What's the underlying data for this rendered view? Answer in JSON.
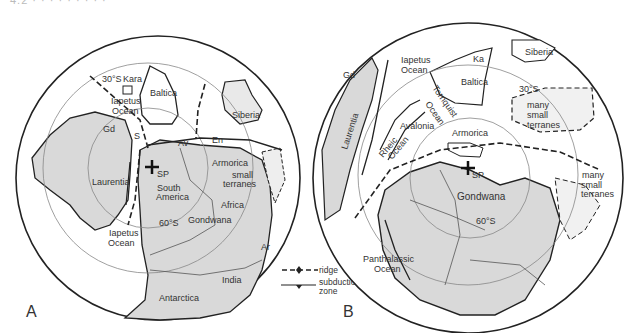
{
  "header": {
    "text": "4.2     ·  ·  ·  ·  ·  ·  ·  ·  ·"
  },
  "panel_a": {
    "letter": "A",
    "labels": {
      "lat30": "30°S",
      "kara": "Kara",
      "baltica": "Baltica",
      "iapetus1": "Iapetus",
      "ocean1": "Ocean",
      "siberia": "Siberia",
      "gd": "Gd",
      "s": "S",
      "av": "Av",
      "en": "En",
      "armorica": "Armorica",
      "sp": "SP",
      "laurentia": "Laurentia",
      "south": "South",
      "america": "America",
      "small": "small",
      "terranes": "terranes",
      "africa": "Africa",
      "gondwana": "Gondwana",
      "lat60": "60°S",
      "iapetus2": "Iapetus",
      "ocean2": "Ocean",
      "ar": "Ar",
      "india": "India",
      "antarctica": "Antarctica"
    }
  },
  "legend": {
    "ridge": "ridge",
    "subduction1": "subduction",
    "subduction2": "zone"
  },
  "panel_b": {
    "letter": "B",
    "labels": {
      "gd": "Gd",
      "iapetus": "Iapetus",
      "ocean": "Ocean",
      "ka": "Ka",
      "baltica": "Baltica",
      "siberia": "Siberia",
      "laurentia": "Laurentia",
      "tornquist": "Tornquist",
      "tocean": "Ocean",
      "lat30": "30°S",
      "many": "many",
      "small": "small",
      "terranes": "terranes",
      "avalonia": "Avalonia",
      "rheic": "Rheic",
      "rocean": "Ocean",
      "armorica": "Armorica",
      "sp": "SP",
      "gondwana": "Gondwana",
      "lat60": "60°S",
      "many2": "many",
      "small2": "small",
      "terranes2": "terranes",
      "panthalassic": "Panthalassic",
      "pocean": "Ocean"
    }
  },
  "colors": {
    "land": "#d9d9d9",
    "stroke": "#222222",
    "grid": "#888888"
  }
}
